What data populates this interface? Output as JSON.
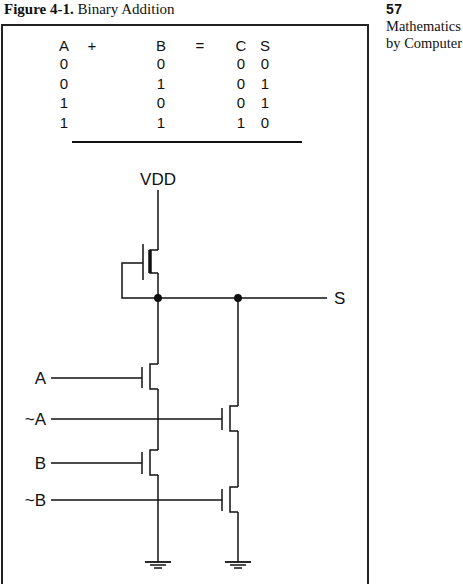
{
  "caption": {
    "label": "Figure 4-1.",
    "title": "Binary Addition"
  },
  "sidebar": {
    "page_number": "57",
    "line1": "Mathematics",
    "line2": "by Computer"
  },
  "truth_table": {
    "headers": {
      "a": "A",
      "plus": "+",
      "b": "B",
      "equals": "=",
      "c": "C",
      "s": "S"
    },
    "rows": [
      {
        "a": "0",
        "b": "0",
        "c": "0",
        "s": "0"
      },
      {
        "a": "0",
        "b": "1",
        "c": "0",
        "s": "1"
      },
      {
        "a": "1",
        "b": "0",
        "c": "0",
        "s": "1"
      },
      {
        "a": "1",
        "b": "1",
        "c": "1",
        "s": "0"
      }
    ]
  },
  "circuit": {
    "supply_label": "VDD",
    "output_label": "S",
    "inputs": {
      "a": "A",
      "not_a": "~A",
      "b": "B",
      "not_b": "~B"
    }
  }
}
